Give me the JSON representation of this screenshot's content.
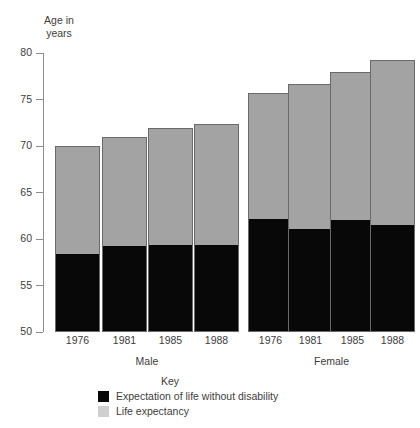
{
  "chart_data": {
    "type": "bar",
    "subtype": "stacked",
    "title": "",
    "ylabel": "Age in years",
    "xlabel": "",
    "ylim": [
      50,
      80
    ],
    "yticks": [
      50,
      55,
      60,
      65,
      70,
      75,
      80
    ],
    "grid": false,
    "legend_position": "bottom",
    "legend_title": "Key",
    "groups": [
      "Male",
      "Female"
    ],
    "categories": [
      "1976",
      "1981",
      "1985",
      "1988"
    ],
    "series": [
      {
        "name": "Expectation of life without disability",
        "color": "#080808",
        "values_male": [
          58.3,
          59.1,
          59.2,
          59.2
        ],
        "values_female": [
          62.0,
          61.0,
          61.9,
          61.4
        ]
      },
      {
        "name": "Life expectancy",
        "color": "#a3a3a3",
        "values_male": [
          70.0,
          71.0,
          71.9,
          72.4
        ],
        "values_female": [
          75.7,
          76.7,
          78.0,
          79.2
        ]
      }
    ],
    "bars": [
      {
        "group": "Male",
        "category": "1976",
        "total": 70.0,
        "without_disability": 58.3
      },
      {
        "group": "Male",
        "category": "1981",
        "total": 71.0,
        "without_disability": 59.1
      },
      {
        "group": "Male",
        "category": "1985",
        "total": 71.9,
        "without_disability": 59.2
      },
      {
        "group": "Male",
        "category": "1988",
        "total": 72.4,
        "without_disability": 59.2
      },
      {
        "group": "Female",
        "category": "1976",
        "total": 75.7,
        "without_disability": 62.0
      },
      {
        "group": "Female",
        "category": "1981",
        "total": 76.7,
        "without_disability": 61.0
      },
      {
        "group": "Female",
        "category": "1985",
        "total": 78.0,
        "without_disability": 61.9
      },
      {
        "group": "Female",
        "category": "1988",
        "total": 79.2,
        "without_disability": 61.4
      }
    ]
  },
  "axis_title": {
    "line1": "Age in",
    "line2": "years"
  },
  "y_tick_labels": [
    "80",
    "75",
    "70",
    "65",
    "60",
    "55",
    "50"
  ],
  "x_tick_labels": [
    "1976",
    "1981",
    "1985",
    "1988",
    "1976",
    "1981",
    "1985",
    "1988"
  ],
  "group_labels": [
    "Male",
    "Female"
  ],
  "key": {
    "title": "Key",
    "entries": [
      {
        "label": "Expectation of life without disability",
        "color": "#080808"
      },
      {
        "label": "Life expectancy",
        "color": "#cfcfcf"
      }
    ]
  },
  "colors": {
    "bar_grey": "#a3a3a3",
    "bar_black": "#080808",
    "bar_border": "#6a6a6a",
    "axis": "#8d8d8d",
    "text": "#3d3d3d",
    "background": "#ffffff"
  }
}
